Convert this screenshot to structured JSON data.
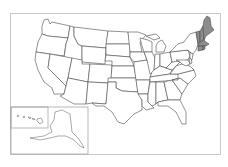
{
  "map": {
    "title": "",
    "subject": "United States states outline map",
    "highlighted_region": "New England",
    "highlighted_states": [
      "Maine",
      "New Hampshire",
      "Vermont",
      "Massachusetts",
      "Rhode Island",
      "Connecticut"
    ],
    "colors": {
      "background": "#ffffff",
      "state_fill": "#ffffff",
      "state_stroke": "#4a4a4a",
      "highlight_fill": "#8c8c8c",
      "frame_stroke": "#c8c8c8"
    },
    "insets": [
      {
        "name": "Hawaii",
        "position": "bottom-left, upper-left box"
      },
      {
        "name": "Alaska",
        "position": "bottom-left"
      }
    ]
  }
}
